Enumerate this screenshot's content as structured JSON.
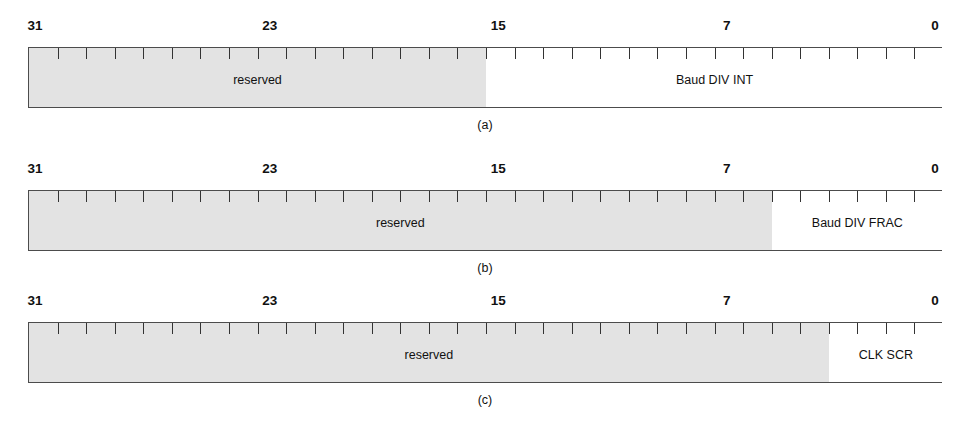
{
  "figure": {
    "bit_width": 32,
    "tick_count": 31,
    "colors": {
      "reserved_fill": "#e3e3e3",
      "field_fill": "#ffffff",
      "border": "#4c4c4c",
      "tick": "#333333",
      "text": "#111111",
      "background": "#ffffff"
    },
    "geometry": {
      "box_left_px": 28,
      "box_width_px": 914,
      "box_height_px": 61
    }
  },
  "bit_ruler": {
    "labels": [
      "31",
      "23",
      "15",
      "7",
      "0"
    ],
    "label_bits": [
      31,
      23,
      15,
      7,
      0
    ]
  },
  "diagrams": [
    {
      "caption": "(a)",
      "box_top_px": 47,
      "labels_top_px": 18,
      "caption_top_px": 118,
      "fields": [
        {
          "label": "reserved",
          "msb": 31,
          "lsb": 16,
          "width_bits": 16,
          "style": "shaded"
        },
        {
          "label": "Baud DIV INT",
          "msb": 15,
          "lsb": 0,
          "width_bits": 16,
          "style": "plain"
        }
      ]
    },
    {
      "caption": "(b)",
      "box_top_px": 190,
      "labels_top_px": 161,
      "caption_top_px": 261,
      "fields": [
        {
          "label": "reserved",
          "msb": 31,
          "lsb": 6,
          "width_bits": 26,
          "style": "shaded"
        },
        {
          "label": "Baud DIV FRAC",
          "msb": 5,
          "lsb": 0,
          "width_bits": 6,
          "style": "plain"
        }
      ]
    },
    {
      "caption": "(c)",
      "box_top_px": 322,
      "labels_top_px": 293,
      "caption_top_px": 393,
      "fields": [
        {
          "label": "reserved",
          "msb": 31,
          "lsb": 4,
          "width_bits": 28,
          "style": "shaded"
        },
        {
          "label": "CLK SCR",
          "msb": 3,
          "lsb": 0,
          "width_bits": 4,
          "style": "plain"
        }
      ]
    }
  ]
}
